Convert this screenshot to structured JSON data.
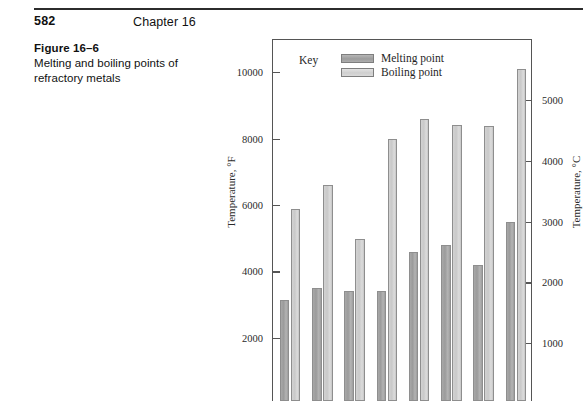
{
  "page": {
    "folio": "582",
    "running_head": "Chapter 16"
  },
  "caption": {
    "label": "Figure 16–6",
    "text": "Melting and boiling points of refractory metals"
  },
  "legend": {
    "key_label": "Key",
    "entries": [
      {
        "label": "Melting point",
        "color": "#a0a0a0"
      },
      {
        "label": "Boiling point",
        "color": "#d2d2d2"
      }
    ]
  },
  "chart_data": {
    "type": "bar",
    "title": "Melting and boiling points of refractory metals",
    "xlabel": "",
    "ylabel": "Temperature, °F",
    "ylabel_secondary": "Temperature, °C",
    "grid": false,
    "legend_position": "top-left (inside plot)",
    "ylim": [
      0,
      11000
    ],
    "ylim_secondary": [
      0,
      6000
    ],
    "yticks": [
      2000,
      4000,
      6000,
      8000,
      10000
    ],
    "yticks_secondary": [
      1000,
      2000,
      3000,
      4000,
      5000
    ],
    "ytick_labels": [
      "2000",
      "4000",
      "6000",
      "8000",
      "10000"
    ],
    "ytick_labels_secondary": [
      "1000",
      "2000",
      "3000",
      "4000",
      "5000"
    ],
    "categories": [
      "1",
      "2",
      "3",
      "4",
      "5",
      "6",
      "7",
      "8"
    ],
    "series": [
      {
        "name": "Melting point",
        "values": [
          3050,
          3420,
          3330,
          3330,
          4500,
          4700,
          4100,
          5400
        ]
      },
      {
        "name": "Boiling point",
        "values": [
          5780,
          6500,
          4870,
          7900,
          8500,
          8320,
          8280,
          10000
        ]
      }
    ]
  }
}
